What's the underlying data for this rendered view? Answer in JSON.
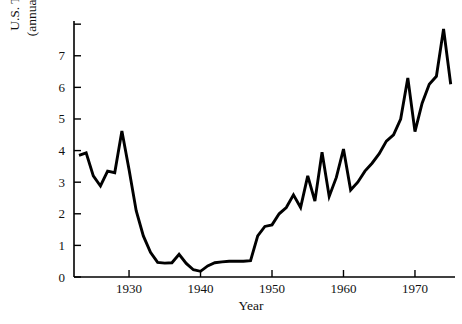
{
  "chart_data": {
    "type": "line",
    "title": "",
    "xlabel": "Year",
    "ylabel": "U.S. Treasury Bill Rates (annual percentage return)",
    "ylabel_line1": "U.S. Treasury Bill Rates",
    "ylabel_line2": "(annual percentage return)",
    "xlim": [
      1922.3,
      1975.6
    ],
    "ylim": [
      0,
      8.1
    ],
    "xticks": [
      1930,
      1940,
      1950,
      1960,
      1970
    ],
    "xtick_labels": [
      "1930",
      "1940",
      "1950",
      "1960",
      "1970"
    ],
    "yticks": [
      0,
      1,
      2,
      3,
      4,
      5,
      6,
      7,
      8
    ],
    "ytick_labels": [
      "0",
      "1",
      "2",
      "3",
      "4",
      "5",
      "6",
      "7",
      ""
    ],
    "grid": false,
    "legend": false,
    "line_color": "#000000",
    "series": [
      {
        "name": "U.S. Treasury Bill Rates",
        "x": [
          1923,
          1924,
          1925,
          1926,
          1927,
          1928,
          1929,
          1930,
          1931,
          1932,
          1933,
          1934,
          1935,
          1936,
          1937,
          1938,
          1939,
          1940,
          1941,
          1942,
          1943,
          1944,
          1945,
          1946,
          1947,
          1948,
          1949,
          1950,
          1951,
          1952,
          1953,
          1954,
          1955,
          1956,
          1957,
          1958,
          1959,
          1960,
          1961,
          1962,
          1963,
          1964,
          1965,
          1966,
          1967,
          1968,
          1969,
          1970,
          1971,
          1972,
          1973,
          1974,
          1975
        ],
        "y": [
          3.85,
          3.93,
          3.2,
          2.88,
          3.35,
          3.3,
          4.62,
          3.4,
          2.1,
          1.3,
          0.78,
          0.46,
          0.44,
          0.45,
          0.72,
          0.43,
          0.23,
          0.18,
          0.35,
          0.45,
          0.48,
          0.5,
          0.5,
          0.5,
          0.52,
          1.3,
          1.6,
          1.65,
          2.0,
          2.2,
          2.6,
          2.2,
          3.2,
          2.4,
          3.95,
          2.55,
          3.15,
          4.05,
          2.75,
          3.0,
          3.35,
          3.6,
          3.9,
          4.3,
          4.5,
          5.0,
          6.3,
          4.6,
          5.5,
          6.1,
          6.35,
          7.85,
          6.1
        ]
      }
    ]
  }
}
